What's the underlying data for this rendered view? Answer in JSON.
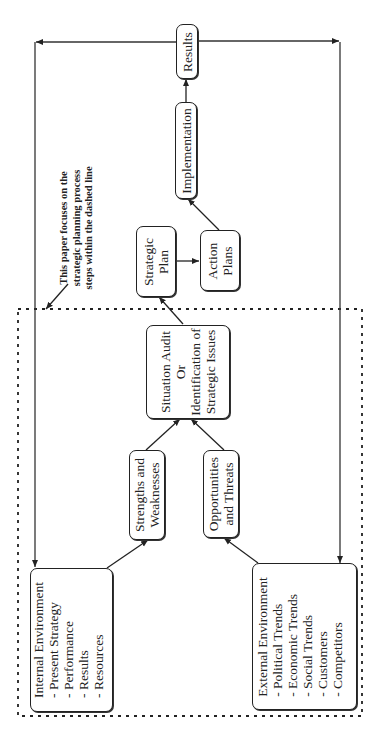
{
  "diagram": {
    "title": "Strategic planning process",
    "orientation": "rotated 90 degrees counter-clockwise",
    "nodes": {
      "results": {
        "label": "Results"
      },
      "implementation": {
        "label": "Implementation"
      },
      "strategic_plan": {
        "lines": [
          "Strategic",
          "Plan"
        ]
      },
      "action_plans": {
        "lines": [
          "Action",
          "Plans"
        ]
      },
      "situation_audit": {
        "lines": [
          "Situation Audit",
          "Or",
          "Identification of",
          "Strategic Issues"
        ]
      },
      "strengths": {
        "lines": [
          "Strengths and",
          "Weaknesses"
        ]
      },
      "opportunities": {
        "lines": [
          "Opportunities",
          "and Threats"
        ]
      },
      "internal_env": {
        "title": "Internal  Environment",
        "items": [
          "-  Present Strategy",
          "-  Performance",
          "-  Results",
          "-  Resources"
        ]
      },
      "external_env": {
        "title": "External  Environment",
        "items": [
          "-  Political Trends",
          "-  Economic Trends",
          "-  Social Trends",
          "-  Customers",
          "-  Competitors"
        ]
      }
    },
    "note": {
      "lines": [
        "This paper focuses on the",
        "strategic planning process",
        "steps within the dashed line"
      ]
    },
    "edges": [
      {
        "from": "internal_env",
        "to": "strengths"
      },
      {
        "from": "external_env",
        "to": "opportunities"
      },
      {
        "from": "strengths",
        "to": "situation_audit"
      },
      {
        "from": "opportunities",
        "to": "situation_audit"
      },
      {
        "from": "situation_audit",
        "to": "strategic_plan"
      },
      {
        "from": "strategic_plan",
        "to": "action_plans"
      },
      {
        "from": "action_plans",
        "to": "implementation"
      },
      {
        "from": "implementation",
        "to": "results"
      },
      {
        "from": "results",
        "to": "internal_env",
        "type": "feedback"
      },
      {
        "from": "results",
        "to": "external_env",
        "type": "feedback"
      }
    ],
    "colors": {
      "line": "#222222",
      "background": "#ffffff"
    }
  }
}
